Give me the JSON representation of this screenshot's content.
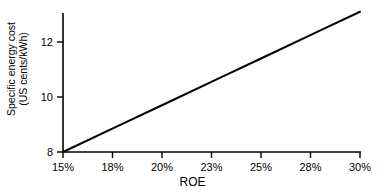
{
  "chart_data": {
    "type": "line",
    "title": "",
    "xlabel": "ROE",
    "ylabel_line1": "Specific energy cost",
    "ylabel_line2": "(US cents/kWh)",
    "x_tick_labels": [
      "15%",
      "18%",
      "20%",
      "23%",
      "25%",
      "28%",
      "30%"
    ],
    "x_values": [
      15,
      18,
      20,
      23,
      25,
      28,
      30
    ],
    "y_tick_labels": [
      "8",
      "10",
      "12"
    ],
    "y_ticks": [
      8,
      10,
      12
    ],
    "xlim": [
      15,
      30
    ],
    "ylim": [
      8,
      13.1
    ],
    "grid": false,
    "legend": "none",
    "series": [
      {
        "name": "Specific energy cost",
        "color": "#000000",
        "x": [
          15,
          18,
          20,
          23,
          25,
          28,
          30
        ],
        "values": [
          8.0,
          9.02,
          9.7,
          10.72,
          11.4,
          12.42,
          13.1
        ]
      }
    ]
  },
  "axes": {
    "x_title": "ROE",
    "y_title_line1": "Specific energy cost",
    "y_title_line2": "(US cents/kWh)"
  },
  "ticks": {
    "x": [
      {
        "label": "15%",
        "px": 63
      },
      {
        "label": "18%",
        "px": 112.5
      },
      {
        "label": "20%",
        "px": 162
      },
      {
        "label": "23%",
        "px": 211.5
      },
      {
        "label": "25%",
        "px": 261
      },
      {
        "label": "28%",
        "px": 310.5
      },
      {
        "label": "30%",
        "px": 360
      }
    ],
    "y": [
      {
        "label": "12",
        "px": 42
      },
      {
        "label": "10",
        "px": 97
      },
      {
        "label": "8",
        "px": 152
      }
    ]
  },
  "colors": {
    "line": "#000000",
    "axis": "#000000",
    "background": "#ffffff"
  }
}
